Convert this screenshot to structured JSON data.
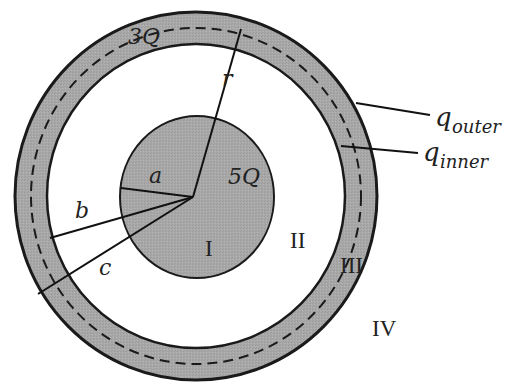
{
  "diagram": {
    "type": "concentric charged sphere and conducting shell",
    "colors": {
      "fill": "#a6a6a6",
      "stroke": "#1a1a1a",
      "background": "#ffffff"
    },
    "labels": {
      "shell_charge": "3Q",
      "sphere_charge": "5Q",
      "radius_r": "r",
      "radius_a": "a",
      "radius_b": "b",
      "radius_c": "c",
      "q_outer_base": "q",
      "q_outer_sub": "outer",
      "q_inner_base": "q",
      "q_inner_sub": "inner"
    },
    "regions": {
      "I": "I",
      "II": "II",
      "III": "III",
      "IV": "IV"
    }
  }
}
